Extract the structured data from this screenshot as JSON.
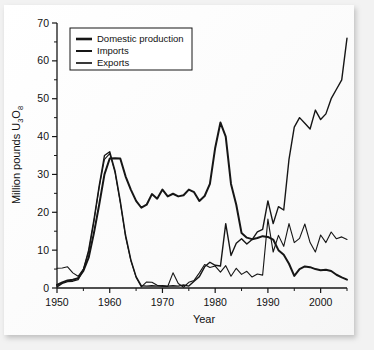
{
  "figure": {
    "background_color": "#f2f2f2",
    "card_color": "#fdfdfd",
    "line_color": "#161616"
  },
  "chart_data": {
    "type": "line",
    "title": "",
    "xlabel": "Year",
    "ylabel": "Million pounds U3O8",
    "ylabel_rich": {
      "prefix": "Million pounds U",
      "sub1": "3",
      "mid": "O",
      "sub2": "8"
    },
    "xlim": [
      1950,
      2005
    ],
    "ylim": [
      0,
      70
    ],
    "xticks": [
      1950,
      1960,
      1970,
      1980,
      1990,
      2000
    ],
    "xtick_labels": [
      "1950",
      "1960",
      "1970",
      "1980",
      "1990",
      "2000"
    ],
    "yticks": [
      0,
      10,
      20,
      30,
      40,
      50,
      60,
      70
    ],
    "ytick_labels": [
      "0",
      "10",
      "20",
      "30",
      "40",
      "50",
      "60",
      "70"
    ],
    "y_minor_ticks": [
      5,
      15,
      25,
      35,
      45,
      55,
      65
    ],
    "x_minor_ticks": [
      1955,
      1965,
      1975,
      1985,
      1995,
      2005
    ],
    "grid": false,
    "legend_position": "upper left",
    "legend_entries": [
      "Domestic production",
      "Imports",
      "Exports"
    ],
    "series": [
      {
        "name": "Domestic production",
        "line_width": 2.0,
        "x": [
          1950,
          1951,
          1952,
          1953,
          1954,
          1955,
          1956,
          1957,
          1958,
          1959,
          1960,
          1961,
          1962,
          1963,
          1964,
          1965,
          1966,
          1967,
          1968,
          1969,
          1970,
          1971,
          1972,
          1973,
          1974,
          1975,
          1976,
          1977,
          1978,
          1979,
          1980,
          1981,
          1982,
          1983,
          1984,
          1985,
          1986,
          1987,
          1988,
          1989,
          1990,
          1991,
          1992,
          1993,
          1994,
          1995,
          1996,
          1997,
          1998,
          1999,
          2000,
          2001,
          2002,
          2003,
          2004,
          2005
        ],
        "y": [
          0.8,
          1.5,
          2.0,
          2.2,
          2.6,
          4.5,
          8.0,
          14.5,
          22.0,
          30.0,
          34.2,
          34.3,
          34.2,
          29.5,
          26.0,
          23.0,
          21.2,
          22.0,
          24.8,
          23.6,
          26.0,
          24.2,
          24.9,
          24.2,
          24.5,
          26.0,
          25.3,
          23.0,
          24.3,
          27.5,
          37.0,
          43.7,
          40.0,
          27.5,
          22.0,
          14.5,
          13.3,
          12.9,
          13.2,
          13.7,
          13.5,
          12.8,
          10.0,
          8.8,
          6.4,
          3.2,
          5.0,
          5.7,
          5.5,
          5.0,
          4.7,
          4.8,
          4.5,
          3.5,
          2.8,
          2.2
        ]
      },
      {
        "name": "Imports",
        "line_width": 1.4,
        "x": [
          1950,
          1951,
          1952,
          1953,
          1954,
          1955,
          1956,
          1957,
          1958,
          1959,
          1960,
          1961,
          1962,
          1963,
          1964,
          1965,
          1966,
          1967,
          1968,
          1969,
          1970,
          1971,
          1972,
          1973,
          1974,
          1975,
          1976,
          1977,
          1978,
          1979,
          1980,
          1981,
          1982,
          1983,
          1984,
          1985,
          1986,
          1987,
          1988,
          1989,
          1990,
          1991,
          1992,
          1993,
          1994,
          1995,
          1996,
          1997,
          1998,
          1999,
          2000,
          2001,
          2002,
          2003,
          2004,
          2005
        ],
        "y": [
          0.3,
          1.2,
          1.7,
          1.8,
          2.2,
          4.8,
          10.0,
          18.0,
          27.0,
          35.0,
          36.0,
          31.0,
          23.0,
          14.0,
          7.5,
          3.0,
          0.6,
          0.5,
          0.6,
          0.5,
          0.6,
          0.5,
          0.6,
          0.5,
          0.8,
          0.5,
          1.8,
          3.0,
          5.6,
          6.8,
          6.0,
          5.8,
          17.0,
          8.6,
          11.8,
          13.0,
          11.6,
          12.8,
          14.8,
          15.5,
          23.0,
          17.0,
          21.5,
          20.6,
          34.0,
          42.5,
          45.0,
          43.5,
          42.0,
          47.0,
          44.5,
          46.0,
          50.0,
          52.5,
          55.0,
          66.0
        ]
      },
      {
        "name": "Exports",
        "line_width": 1.1,
        "x": [
          1950,
          1951,
          1952,
          1953,
          1954,
          1955,
          1956,
          1957,
          1958,
          1959,
          1960,
          1961,
          1962,
          1963,
          1964,
          1965,
          1966,
          1967,
          1968,
          1969,
          1970,
          1971,
          1972,
          1973,
          1974,
          1975,
          1976,
          1977,
          1978,
          1979,
          1980,
          1981,
          1982,
          1983,
          1984,
          1985,
          1986,
          1987,
          1988,
          1989,
          1990,
          1991,
          1992,
          1993,
          1994,
          1995,
          1996,
          1997,
          1998,
          1999,
          2000,
          2001,
          2002,
          2003,
          2004,
          2005
        ],
        "y": [
          5.2,
          5.3,
          5.6,
          4.0,
          3.1,
          5.0,
          9.5,
          17.5,
          26.5,
          34.0,
          35.5,
          30.5,
          22.5,
          13.5,
          7.2,
          2.8,
          0.3,
          1.6,
          1.5,
          0.7,
          0.5,
          0.4,
          4.0,
          1.2,
          0.2,
          1.5,
          2.0,
          4.0,
          6.2,
          5.4,
          5.8,
          4.2,
          5.9,
          3.1,
          5.2,
          3.6,
          4.4,
          2.9,
          3.7,
          3.4,
          18.2,
          9.5,
          13.9,
          11.0,
          17.0,
          12.0,
          13.1,
          16.9,
          12.0,
          9.5,
          14.0,
          12.0,
          14.8,
          13.0,
          13.5,
          12.8
        ]
      }
    ]
  }
}
